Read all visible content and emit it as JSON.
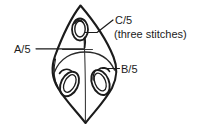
{
  "figure": {
    "name": "knitting-leaf-motif-diagram",
    "background_color": "#ffffff",
    "stroke_color": "#1b1b1b",
    "labels": {
      "a": "A/5",
      "b": "B/5",
      "c": "C/5",
      "c_note": "(three stitches)"
    },
    "shapes": {
      "outline": "pointed-oval-leaf",
      "center_line": "vertical",
      "divider_line": "horizontal-upper",
      "top_loop": "small-vertical-oval",
      "left_loop": "tilted-eye-oval",
      "right_loop": "tilted-eye-oval"
    },
    "leaders": {
      "a_leader": "horizontal-line-left",
      "b_leader": "horizontal-line-right",
      "c_leader": "diagonal-line-upper-right"
    }
  }
}
